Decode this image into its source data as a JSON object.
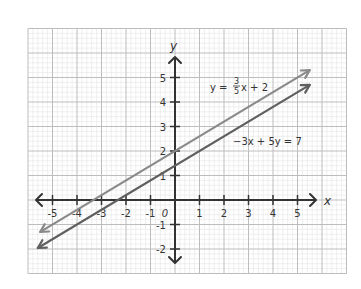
{
  "chart_data": {
    "type": "line",
    "title": "",
    "xlabel": "x",
    "ylabel": "y",
    "xlim": [
      -6,
      7
    ],
    "ylim": [
      -3,
      7
    ],
    "grid": true,
    "x_ticks": [
      -5,
      -4,
      -3,
      -2,
      -1,
      0,
      1,
      2,
      3,
      4,
      5
    ],
    "y_ticks": [
      -2,
      -1,
      1,
      2,
      3,
      4,
      5
    ],
    "x_tick_labels": [
      "-5",
      "-4",
      "-3",
      "-2",
      "-1",
      "0",
      "1",
      "2",
      "3",
      "4",
      "5"
    ],
    "y_tick_labels": [
      "-2",
      "-1",
      "1",
      "2",
      "3",
      "4",
      "5"
    ],
    "series": [
      {
        "name": "y = 3/5x + 2",
        "equation": "y = (3/5)x + 2",
        "slope": 0.6,
        "intercept": 2,
        "x_range": [
          -5.5,
          5.5
        ],
        "points": [
          [
            -5.5,
            -1.3
          ],
          [
            5.5,
            5.3
          ]
        ],
        "color": "#8a8a8a",
        "label": {
          "prefix": "y =",
          "num": "3",
          "den": "5",
          "suffix": "x + 2"
        }
      },
      {
        "name": "-3x + 5y = 7",
        "equation": "-3x + 5y = 7",
        "slope": 0.6,
        "intercept": 1.4,
        "x_range": [
          -5.6,
          5.5
        ],
        "points": [
          [
            -5.6,
            -1.96
          ],
          [
            5.5,
            4.7
          ]
        ],
        "color": "#5f5f5f",
        "label": {
          "text": "−3x + 5y = 7"
        }
      }
    ],
    "annotations": [
      "y = 3/5x + 2",
      "−3x + 5y = 7"
    ]
  },
  "colors": {
    "axis": "#333333",
    "grid_major": "#bdbdbd",
    "grid_minor": "#e4e4e4",
    "background": "#ffffff"
  }
}
